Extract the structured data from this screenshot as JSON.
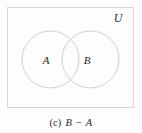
{
  "figure": {
    "universe_label": "U",
    "sets": [
      {
        "id": "A",
        "label": "A"
      },
      {
        "id": "B",
        "label": "B"
      }
    ],
    "caption": {
      "tag": "(c)",
      "expression": "B − A"
    },
    "colors": {
      "background": "#fdfdfd",
      "universe_border": "#d6d6d6",
      "circle_stroke": "#c9c9c9",
      "circle_fill": "#ffffff",
      "label_text": "#262626",
      "caption_text": "#2b2b2b"
    },
    "geometry": {
      "universe_rect": {
        "x": 7,
        "y": 7,
        "width": 127,
        "height": 101
      },
      "circle_a": {
        "cx": 50.5,
        "cy": 59.5,
        "r": 28.5
      },
      "circle_b": {
        "cx": 90.5,
        "cy": 59.5,
        "r": 28.5
      },
      "label_a_pos": {
        "x": 46,
        "y": 63
      },
      "label_b_pos": {
        "x": 87,
        "y": 63
      },
      "universe_label_pos": {
        "x": 118,
        "y": 22
      }
    }
  }
}
